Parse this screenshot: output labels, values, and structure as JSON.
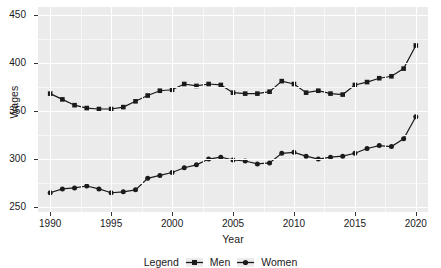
{
  "chart_data": {
    "type": "line",
    "title": "",
    "subtitle": "",
    "xlabel": "Year",
    "ylabel": "Wages",
    "xlim": [
      1989,
      2021
    ],
    "ylim": [
      245,
      458
    ],
    "xticks": [
      "1990",
      "1995",
      "2000",
      "2005",
      "2010",
      "2015",
      "2020"
    ],
    "xtick_values": [
      1990,
      1995,
      2000,
      2005,
      2010,
      2015,
      2020
    ],
    "yticks": [
      "250",
      "300",
      "350",
      "400",
      "450"
    ],
    "ytick_values": [
      250,
      300,
      350,
      400,
      450
    ],
    "grid": true,
    "legend_position": "bottom",
    "legend_title": "Legend",
    "x": [
      1990,
      1991,
      1992,
      1993,
      1994,
      1995,
      1996,
      1997,
      1998,
      1999,
      2000,
      2001,
      2002,
      2003,
      2004,
      2005,
      2006,
      2007,
      2008,
      2009,
      2010,
      2011,
      2012,
      2013,
      2014,
      2015,
      2016,
      2017,
      2018,
      2019,
      2020
    ],
    "series": [
      {
        "name": "Men",
        "color": "#1a1a1a",
        "marker": "square",
        "values": [
          368,
          362,
          356,
          353,
          352,
          352,
          354,
          360,
          366,
          371,
          372,
          378,
          376,
          378,
          377,
          369,
          368,
          368,
          370,
          381,
          378,
          369,
          371,
          368,
          367,
          377,
          380,
          384,
          386,
          394,
          418
        ]
      },
      {
        "name": "Women",
        "color": "#1a1a1a",
        "marker": "circle",
        "values": [
          265,
          269,
          270,
          272,
          269,
          265,
          266,
          268,
          280,
          283,
          286,
          291,
          294,
          300,
          302,
          299,
          298,
          295,
          296,
          306,
          307,
          303,
          300,
          302,
          303,
          306,
          311,
          314,
          313,
          321,
          344
        ]
      }
    ]
  },
  "axes": {
    "ylabel": "Wages",
    "xlabel": "Year"
  },
  "legend": {
    "title": "Legend",
    "items": [
      {
        "label": "Men"
      },
      {
        "label": "Women"
      }
    ]
  },
  "colors": {
    "panel_background": "#ebebeb",
    "grid_major": "#ffffff",
    "grid_minor": "#f7f7f7",
    "line": "#1a1a1a",
    "text": "#1a1a1a",
    "page_background": "#ffffff"
  }
}
